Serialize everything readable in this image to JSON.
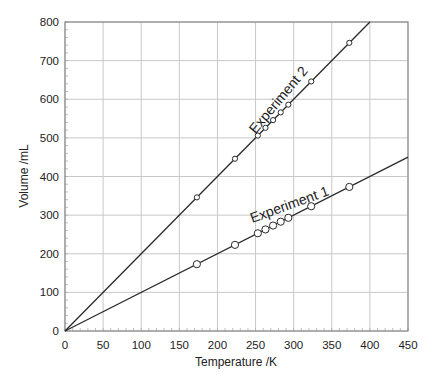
{
  "chart_data": {
    "type": "line",
    "title": "",
    "xlabel": "Temperature /K",
    "ylabel": "Volume /mL",
    "xlim": [
      0,
      450
    ],
    "ylim": [
      0,
      800
    ],
    "xticks": [
      0,
      50,
      100,
      150,
      200,
      250,
      300,
      350,
      400,
      450
    ],
    "yticks": [
      0,
      100,
      200,
      300,
      400,
      500,
      600,
      700,
      800
    ],
    "grid": true,
    "legend": "none (inline labels)",
    "series": [
      {
        "name": "Experiment 1",
        "marker": "circle",
        "line": {
          "from": [
            0,
            0
          ],
          "to": [
            450,
            450
          ]
        },
        "x": [
          173,
          223,
          253,
          263,
          273,
          283,
          293,
          323,
          373
        ],
        "y": [
          173,
          223,
          253,
          263,
          273,
          283,
          293,
          323,
          373
        ]
      },
      {
        "name": "Experiment 2",
        "marker": "small-circle",
        "line": {
          "from": [
            0,
            0
          ],
          "to": [
            400,
            800
          ]
        },
        "x": [
          173,
          223,
          253,
          263,
          273,
          283,
          293,
          323,
          373
        ],
        "y": [
          346,
          446,
          506,
          526,
          546,
          566,
          586,
          646,
          746
        ]
      }
    ]
  },
  "labels": {
    "xlabel": "Temperature /K",
    "ylabel": "Volume /mL",
    "exp1": "Experiment 1",
    "exp2": "Experiment 2"
  },
  "colors": {
    "line": "#2a2a2a",
    "grid": "#c8c8c8",
    "axis": "#8a8a8a",
    "marker_fill": "#ffffff"
  }
}
